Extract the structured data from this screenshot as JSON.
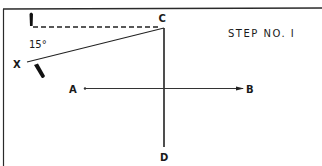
{
  "diagram": {
    "title": "STEP NO. I",
    "angle_label": "15°",
    "points": {
      "A": "A",
      "B": "B",
      "C": "C",
      "D": "D",
      "X": "X"
    },
    "colors": {
      "ink": "#1a1a1a",
      "background": "#ffffff"
    }
  }
}
